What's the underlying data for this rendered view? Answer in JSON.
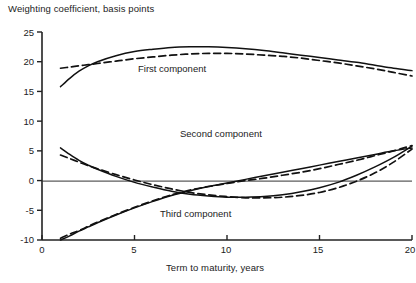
{
  "chart_data": {
    "type": "line",
    "title": "Weighting coefficient, basis points",
    "ylabel": "Weighting coefficient, basis points",
    "xlabel": "Term to maturity, years",
    "xlim": [
      0,
      20
    ],
    "ylim": [
      -10,
      25
    ],
    "xticks": [
      0,
      5,
      10,
      15,
      20
    ],
    "yticks": [
      -10,
      -5,
      0,
      5,
      10,
      15,
      20,
      25
    ],
    "grid": false,
    "legend": "inline-annotations",
    "zero_line": 0,
    "annotations": [
      {
        "text": "First component",
        "x": 8.5,
        "y": 18.5
      },
      {
        "text": "Second component",
        "x": 11.0,
        "y": 7.0
      },
      {
        "text": "Third component",
        "x": 9.5,
        "y": -5.5
      }
    ],
    "series": [
      {
        "name": "First component",
        "style": "solid",
        "x": [
          1,
          1.5,
          2,
          2.5,
          3,
          4,
          5,
          6,
          7,
          8,
          9,
          10,
          11,
          12,
          13,
          14,
          15,
          16,
          17,
          18,
          19,
          20
        ],
        "values": [
          15.8,
          17.2,
          18.4,
          19.3,
          20.0,
          21.0,
          21.7,
          22.1,
          22.4,
          22.5,
          22.5,
          22.4,
          22.2,
          21.9,
          21.5,
          21.1,
          20.7,
          20.3,
          19.9,
          19.4,
          18.9,
          18.5
        ]
      },
      {
        "name": "First component (fitted)",
        "style": "dashed",
        "x": [
          1,
          1.5,
          2,
          2.5,
          3,
          4,
          5,
          6,
          7,
          8,
          9,
          10,
          11,
          12,
          13,
          14,
          15,
          16,
          17,
          18,
          19,
          20
        ],
        "values": [
          18.9,
          19.1,
          19.3,
          19.5,
          19.7,
          20.1,
          20.5,
          20.8,
          21.1,
          21.3,
          21.4,
          21.4,
          21.3,
          21.1,
          20.9,
          20.6,
          20.2,
          19.8,
          19.3,
          18.8,
          18.2,
          17.6
        ]
      },
      {
        "name": "Second component",
        "style": "solid",
        "x": [
          1,
          1.5,
          2,
          2.5,
          3,
          4,
          5,
          6,
          7,
          8,
          9,
          10,
          11,
          12,
          13,
          14,
          15,
          16,
          17,
          18,
          19,
          20
        ],
        "values": [
          5.5,
          4.4,
          3.4,
          2.6,
          1.9,
          0.7,
          -0.3,
          -1.1,
          -1.8,
          -2.3,
          -2.6,
          -2.8,
          -2.8,
          -2.7,
          -2.4,
          -1.9,
          -1.2,
          -0.3,
          0.9,
          2.3,
          3.9,
          5.8
        ]
      },
      {
        "name": "Second component (fitted)",
        "style": "dashed",
        "x": [
          1,
          1.5,
          2,
          2.5,
          3,
          4,
          5,
          6,
          7,
          8,
          9,
          10,
          11,
          12,
          13,
          14,
          15,
          16,
          17,
          18,
          19,
          20
        ],
        "values": [
          4.3,
          3.7,
          3.1,
          2.5,
          2.0,
          1.0,
          0.1,
          -0.7,
          -1.4,
          -2.0,
          -2.4,
          -2.7,
          -2.9,
          -2.9,
          -2.8,
          -2.5,
          -2.0,
          -1.2,
          -0.1,
          1.3,
          3.1,
          5.3
        ]
      },
      {
        "name": "Third component",
        "style": "solid",
        "x": [
          1,
          1.5,
          2,
          2.5,
          3,
          4,
          5,
          6,
          7,
          8,
          9,
          10,
          11,
          12,
          13,
          14,
          15,
          16,
          17,
          18,
          19,
          20
        ],
        "values": [
          -10.0,
          -9.3,
          -8.5,
          -7.8,
          -7.1,
          -5.8,
          -4.6,
          -3.5,
          -2.5,
          -1.7,
          -1.0,
          -0.4,
          0.2,
          0.8,
          1.4,
          2.0,
          2.6,
          3.2,
          3.8,
          4.4,
          5.0,
          5.5
        ]
      },
      {
        "name": "Third component (fitted)",
        "style": "dashed",
        "x": [
          1,
          1.5,
          2,
          2.5,
          3,
          4,
          5,
          6,
          7,
          8,
          9,
          10,
          11,
          12,
          13,
          14,
          15,
          16,
          17,
          18,
          19,
          20
        ],
        "values": [
          -9.7,
          -9.0,
          -8.4,
          -7.7,
          -7.0,
          -5.7,
          -4.5,
          -3.4,
          -2.4,
          -1.6,
          -1.0,
          -0.5,
          0.0,
          0.4,
          0.9,
          1.4,
          2.0,
          2.7,
          3.4,
          4.2,
          5.0,
          5.9
        ]
      }
    ]
  },
  "axes": {
    "y_tick_labels": [
      "25",
      "20",
      "15",
      "10",
      "5",
      "0",
      "-5",
      "-10"
    ],
    "x_tick_labels": [
      "0",
      "5",
      "10",
      "15",
      "20"
    ]
  },
  "labels": {
    "y_axis_title": "Weighting coefficient, basis points",
    "x_axis_title": "Term to maturity, years",
    "first": "First component",
    "second": "Second component",
    "third": "Third component"
  },
  "colors": {
    "line": "#111111",
    "axis": "#222222",
    "background": "#ffffff"
  }
}
